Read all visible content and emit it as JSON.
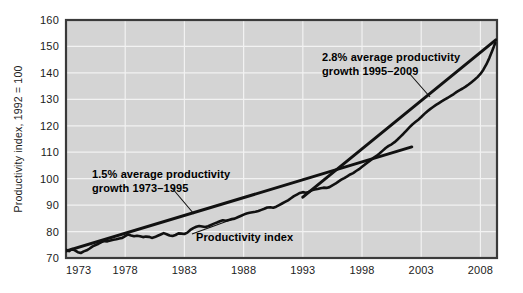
{
  "chart_data": {
    "type": "line",
    "title": "",
    "xlabel": "",
    "ylabel": "Productivity index, 1992 = 100",
    "xlim": [
      1973,
      2009.4
    ],
    "ylim": [
      70,
      160
    ],
    "grid": true,
    "legend_position": "none",
    "background_color": "#d4d4d4",
    "line_color": "#111111",
    "xticks": [
      "1973",
      "1978",
      "1983",
      "1988",
      "1993",
      "1998",
      "2003",
      "2008"
    ],
    "xtick_values": [
      1973,
      1978,
      1983,
      1988,
      1993,
      1998,
      2003,
      2008
    ],
    "yticks": [
      "70",
      "80",
      "90",
      "100",
      "110",
      "120",
      "130",
      "140",
      "150",
      "160"
    ],
    "ytick_values": [
      70,
      80,
      90,
      100,
      110,
      120,
      130,
      140,
      150,
      160
    ],
    "series": [
      {
        "name": "Productivity index",
        "x": [
          1973.0,
          1973.25,
          1973.5,
          1973.75,
          1974.0,
          1974.25,
          1974.5,
          1974.75,
          1975.0,
          1975.25,
          1975.5,
          1975.75,
          1976.0,
          1976.25,
          1976.5,
          1976.75,
          1977.0,
          1977.25,
          1977.5,
          1977.75,
          1978.0,
          1978.25,
          1978.5,
          1978.75,
          1979.0,
          1979.25,
          1979.5,
          1979.75,
          1980.0,
          1980.25,
          1980.5,
          1980.75,
          1981.0,
          1981.25,
          1981.5,
          1981.75,
          1982.0,
          1982.25,
          1982.5,
          1982.75,
          1983.0,
          1983.25,
          1983.5,
          1983.75,
          1984.0,
          1984.25,
          1984.5,
          1984.75,
          1985.0,
          1985.25,
          1985.5,
          1985.75,
          1986.0,
          1986.25,
          1986.5,
          1986.75,
          1987.0,
          1987.25,
          1987.5,
          1987.75,
          1988.0,
          1988.25,
          1988.5,
          1988.75,
          1989.0,
          1989.25,
          1989.5,
          1989.75,
          1990.0,
          1990.25,
          1990.5,
          1990.75,
          1991.0,
          1991.25,
          1991.5,
          1991.75,
          1992.0,
          1992.25,
          1992.5,
          1992.75,
          1993.0,
          1993.25,
          1993.5,
          1993.75,
          1994.0,
          1994.25,
          1994.5,
          1994.75,
          1995.0,
          1995.25,
          1995.5,
          1995.75,
          1996.0,
          1996.25,
          1996.5,
          1996.75,
          1997.0,
          1997.25,
          1997.5,
          1997.75,
          1998.0,
          1998.25,
          1998.5,
          1998.75,
          1999.0,
          1999.25,
          1999.5,
          1999.75,
          2000.0,
          2000.25,
          2000.5,
          2000.75,
          2001.0,
          2001.25,
          2001.5,
          2001.75,
          2002.0,
          2002.25,
          2002.5,
          2002.75,
          2003.0,
          2003.25,
          2003.5,
          2003.75,
          2004.0,
          2004.25,
          2004.5,
          2004.75,
          2005.0,
          2005.25,
          2005.5,
          2005.75,
          2006.0,
          2006.25,
          2006.5,
          2006.75,
          2007.0,
          2007.25,
          2007.5,
          2007.75,
          2008.0,
          2008.25,
          2008.5,
          2008.75,
          2009.0,
          2009.25
        ],
        "y": [
          73.1,
          72.6,
          73.4,
          72.9,
          72.2,
          71.9,
          72.5,
          72.9,
          73.6,
          74.4,
          74.9,
          75.4,
          76.0,
          76.4,
          76.3,
          76.6,
          76.9,
          77.1,
          77.4,
          77.6,
          78.3,
          78.9,
          78.5,
          78.2,
          78.4,
          78.2,
          77.9,
          78.1,
          78.0,
          77.6,
          77.9,
          78.4,
          78.9,
          79.4,
          79.0,
          78.5,
          78.3,
          78.7,
          79.3,
          79.2,
          79.1,
          79.6,
          80.6,
          81.3,
          81.8,
          82.1,
          81.9,
          81.7,
          82.0,
          82.5,
          83.0,
          83.4,
          83.9,
          84.3,
          84.1,
          84.4,
          84.7,
          84.9,
          85.4,
          85.9,
          86.4,
          86.8,
          87.1,
          87.3,
          87.5,
          87.8,
          88.2,
          88.6,
          89.1,
          89.2,
          89.0,
          89.4,
          90.0,
          90.6,
          91.2,
          91.8,
          92.6,
          93.4,
          94.0,
          94.6,
          94.9,
          94.7,
          95.0,
          95.6,
          95.9,
          96.1,
          96.4,
          96.6,
          96.5,
          96.8,
          97.5,
          98.1,
          98.9,
          99.6,
          100.2,
          100.9,
          101.6,
          102.1,
          102.9,
          103.6,
          104.5,
          105.4,
          106.2,
          107.1,
          108.0,
          108.7,
          109.6,
          110.6,
          111.6,
          112.4,
          113.0,
          113.8,
          114.8,
          115.9,
          117.0,
          118.2,
          119.4,
          120.5,
          121.4,
          122.3,
          123.3,
          124.4,
          125.4,
          126.3,
          127.1,
          127.9,
          128.6,
          129.3,
          130.0,
          130.6,
          131.3,
          132.0,
          132.8,
          133.5,
          134.1,
          134.8,
          135.6,
          136.5,
          137.4,
          138.4,
          139.6,
          141.2,
          143.2,
          145.6,
          148.4,
          151.3
        ]
      }
    ],
    "trend_lines": [
      {
        "name": "trend-1973-1995",
        "label": "1.5% average productivity growth 1973–1995",
        "growth_rate": "1.5%",
        "period": "1973–1995",
        "x_start": 1973.0,
        "y_start": 72.6,
        "x_end": 2002.2,
        "y_end": 112.0
      },
      {
        "name": "trend-1995-2009",
        "label": "2.8% average productivity growth 1995–2009",
        "growth_rate": "2.8%",
        "period": "1995–2009",
        "x_start": 1993.0,
        "y_start": 93.0,
        "x_end": 2009.3,
        "y_end": 152.5
      }
    ],
    "annotations": [
      {
        "id": "annotation-1973-1995",
        "line1": "1.5% average productivity",
        "line2": "growth 1973–1995",
        "text_x": 92,
        "text_y": 178,
        "leader": {
          "x1": 172,
          "y1": 188,
          "x2": 194,
          "y2": 214
        }
      },
      {
        "id": "annotation-1995-2009",
        "line1": "2.8% average productivity",
        "line2": "growth 1995–2009",
        "text_x": 322,
        "text_y": 61,
        "leader": {
          "x1": 409,
          "y1": 73,
          "x2": 430,
          "y2": 97
        }
      },
      {
        "id": "annotation-productivity-index",
        "line1": "Productivity index",
        "line2": "",
        "text_x": 196,
        "text_y": 241,
        "leader": {
          "x1": 244,
          "y1": 215,
          "x2": 192,
          "y2": 234
        }
      }
    ]
  },
  "plot": {
    "left": 66,
    "top": 20,
    "right": 497,
    "bottom": 258,
    "frame_color": "#3a3a3a",
    "grid_color": "#f2f2f2"
  }
}
